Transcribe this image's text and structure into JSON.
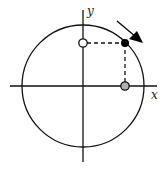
{
  "diagram": {
    "type": "unit-circle-projection",
    "axes": {
      "x_label": "x",
      "y_label": "y"
    },
    "circle": {
      "cx": 83,
      "cy": 86,
      "r": 61
    },
    "points": [
      {
        "name": "point-on-circle",
        "fill": "#000000",
        "cx": 125,
        "cy": 43
      },
      {
        "name": "y-projection",
        "fill": "#ffffff",
        "cx": 83,
        "cy": 43
      },
      {
        "name": "x-projection",
        "fill": "#b0b0b0",
        "cx": 125,
        "cy": 86
      }
    ],
    "arrow": {
      "direction": "clockwise",
      "from": [
        117,
        21
      ],
      "to": [
        143,
        43
      ]
    },
    "colors": {
      "line": "#111111",
      "background": "#ffffff"
    }
  }
}
